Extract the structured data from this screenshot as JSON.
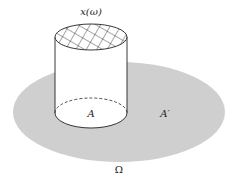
{
  "diagram": {
    "labels": {
      "top": "x(ω)",
      "inner_set": "A",
      "complement": "A′",
      "space": "Ω"
    },
    "colors": {
      "space_fill": "#cfcfcf",
      "cylinder_fill": "#ffffff",
      "stroke": "#222222"
    },
    "elements": [
      {
        "id": "omega-region",
        "shape": "ellipse",
        "label": "Ω"
      },
      {
        "id": "set-A",
        "shape": "ellipse",
        "label": "A"
      },
      {
        "id": "complement",
        "label": "A′"
      },
      {
        "id": "cylinder",
        "top_label": "x(ω)",
        "top_pattern": "crosshatch"
      }
    ]
  }
}
